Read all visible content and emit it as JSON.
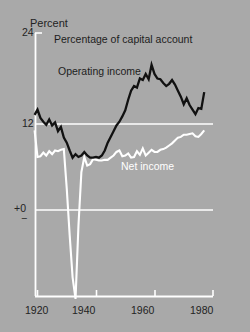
{
  "figure": {
    "background_color": "#a9a9a9",
    "axis_color": "#ffffff",
    "y_axis_label": "Percent",
    "title": "Percentage of capital account"
  },
  "axes": {
    "y_ticks": [
      {
        "label": "24",
        "value": 24
      },
      {
        "label": "12",
        "value": 12
      },
      {
        "label": "+0",
        "value": 0
      },
      {
        "label": "−",
        "value": -1
      }
    ],
    "x_ticks": [
      {
        "label": "1920",
        "value": 1920
      },
      {
        "label": "1940",
        "value": 1940
      },
      {
        "label": "1960",
        "value": 1960
      },
      {
        "label": "1980",
        "value": 1980
      }
    ]
  },
  "series_labels": {
    "operating": "Operating income",
    "net": "Net income"
  },
  "chart_data": {
    "type": "line",
    "title": "Percentage of capital account",
    "xlabel": "",
    "ylabel": "Percent",
    "xlim": [
      1919,
      1980
    ],
    "ylim": [
      -12,
      24
    ],
    "grid": true,
    "gridlines_y": [
      12,
      0
    ],
    "legend_position": "inline-annotations",
    "annotations": [
      {
        "text": "Percentage of capital account",
        "x": 1930,
        "y": 22.2
      },
      {
        "text": "Operating income",
        "x": 1927,
        "y": 18.0
      },
      {
        "text": "Net income",
        "x": 1948,
        "y": 6.5
      }
    ],
    "series": [
      {
        "name": "Operating income",
        "color": "#111111",
        "x": [
          1919,
          1920,
          1921,
          1922,
          1923,
          1924,
          1925,
          1926,
          1927,
          1928,
          1929,
          1930,
          1931,
          1932,
          1933,
          1934,
          1935,
          1936,
          1937,
          1938,
          1939,
          1940,
          1941,
          1942,
          1943,
          1944,
          1945,
          1946,
          1947,
          1948,
          1949,
          1950,
          1951,
          1952,
          1953,
          1954,
          1955,
          1956,
          1957,
          1958,
          1959,
          1960,
          1961,
          1962,
          1963,
          1964,
          1965,
          1966,
          1967,
          1968,
          1969,
          1970,
          1971,
          1972,
          1973,
          1974,
          1975,
          1976,
          1977
        ],
        "values": [
          13.2,
          13.9,
          12.8,
          12.3,
          11.9,
          12.6,
          11.8,
          12.2,
          11.0,
          11.6,
          10.1,
          9.4,
          8.3,
          7.3,
          7.8,
          7.4,
          7.6,
          8.1,
          7.6,
          7.3,
          7.3,
          7.4,
          7.3,
          7.6,
          8.3,
          9.4,
          10.2,
          11.0,
          11.8,
          12.3,
          13.0,
          13.8,
          15.2,
          16.4,
          17.0,
          16.8,
          18.0,
          17.8,
          18.6,
          17.9,
          19.8,
          18.6,
          18.0,
          17.9,
          17.4,
          17.0,
          17.3,
          17.8,
          17.2,
          16.4,
          15.6,
          14.6,
          15.4,
          14.5,
          13.9,
          13.3,
          14.1,
          14.0,
          16.2
        ]
      },
      {
        "name": "Net income",
        "color": "#ffffff",
        "x": [
          1919,
          1920,
          1921,
          1922,
          1923,
          1924,
          1925,
          1926,
          1927,
          1928,
          1929,
          1930,
          1931,
          1932,
          1933,
          1934,
          1935,
          1936,
          1937,
          1938,
          1939,
          1940,
          1941,
          1942,
          1943,
          1944,
          1945,
          1946,
          1947,
          1948,
          1949,
          1950,
          1951,
          1952,
          1953,
          1954,
          1955,
          1956,
          1957,
          1958,
          1959,
          1960,
          1961,
          1962,
          1963,
          1964,
          1965,
          1966,
          1967,
          1968,
          1969,
          1970,
          1971,
          1972,
          1973,
          1974,
          1975,
          1976,
          1977
        ],
        "values": [
          11.1,
          7.4,
          7.5,
          8.0,
          7.6,
          8.2,
          7.8,
          8.3,
          8.2,
          8.4,
          8.5,
          3.0,
          -3.5,
          -9.4,
          -12.4,
          -2.2,
          5.3,
          7.4,
          6.2,
          6.4,
          7.1,
          7.0,
          6.9,
          6.9,
          7.0,
          7.0,
          7.3,
          7.6,
          8.1,
          8.3,
          7.5,
          7.6,
          7.9,
          7.3,
          7.4,
          8.2,
          7.7,
          8.6,
          7.6,
          8.0,
          8.4,
          8.1,
          8.1,
          8.4,
          8.5,
          8.7,
          9.0,
          9.3,
          9.7,
          10.1,
          10.2,
          10.5,
          10.5,
          10.6,
          10.7,
          10.3,
          10.2,
          10.6,
          11.1
        ]
      }
    ]
  }
}
